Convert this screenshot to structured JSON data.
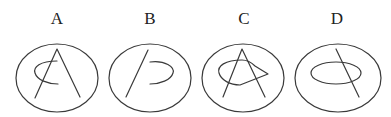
{
  "figures": [
    {
      "label": "A",
      "description": "Ellipse containing an A-shape (inverted V) crossed by an open elliptical arc opening to the right"
    },
    {
      "label": "B",
      "description": "Ellipse containing a slanted line segment and a separate open arc opening to the left"
    },
    {
      "label": "C",
      "description": "Ellipse containing an A-shape (inverted V) overlapped by a teardrop/kite closed curve pointing right"
    },
    {
      "label": "D",
      "description": "Ellipse containing a small closed ellipse crossed by a slanted line segment"
    }
  ],
  "colors": {
    "stroke": "#3a3a3a",
    "background": "#ffffff",
    "label": "#222222"
  }
}
